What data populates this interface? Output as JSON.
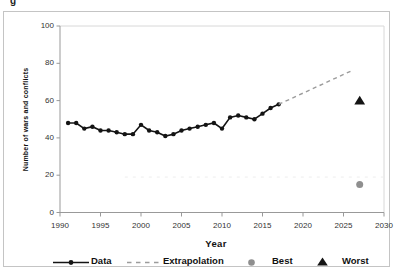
{
  "figure": {
    "corner_fragment": "g",
    "background": "#ffffff",
    "border_color": "#c4c4c4",
    "faint_line": {
      "value": 19,
      "from_year": 1998,
      "to_year": 2030,
      "color": "#ededed"
    }
  },
  "chart_data": {
    "type": "line",
    "title": "",
    "xlabel": "Year",
    "ylabel": "Number of wars and conflicts",
    "xlim": [
      1990,
      2030
    ],
    "ylim": [
      0,
      100
    ],
    "x_ticks": [
      1990,
      1995,
      2000,
      2005,
      2010,
      2015,
      2020,
      2025,
      2030
    ],
    "y_ticks": [
      0,
      20,
      40,
      60,
      80,
      100
    ],
    "grid": "off",
    "legend_position": "bottom",
    "axis_color": "#999999",
    "plot_border_color": "#d8d8d8",
    "series": [
      {
        "name": "Data",
        "type": "line",
        "marker": "circle",
        "color": "#141414",
        "x": [
          1991,
          1992,
          1993,
          1994,
          1995,
          1996,
          1997,
          1998,
          1999,
          2000,
          2001,
          2002,
          2003,
          2004,
          2005,
          2006,
          2007,
          2008,
          2009,
          2010,
          2011,
          2012,
          2013,
          2014,
          2015,
          2016,
          2017
        ],
        "values": [
          48,
          48,
          45,
          46,
          44,
          44,
          43,
          42,
          42,
          47,
          44,
          43,
          41,
          42,
          44,
          45,
          46,
          47,
          48,
          45,
          51,
          52,
          51,
          50,
          53,
          56,
          58
        ]
      },
      {
        "name": "Extrapolation",
        "type": "dashed-line",
        "color": "#9c9c9c",
        "x": [
          2017,
          2026
        ],
        "values": [
          58,
          76
        ]
      },
      {
        "name": "Best",
        "type": "point",
        "marker": "circle",
        "color": "#8f8f8f",
        "x": [
          2027
        ],
        "values": [
          15
        ]
      },
      {
        "name": "Worst",
        "type": "point",
        "marker": "triangle",
        "color": "#141414",
        "x": [
          2027
        ],
        "values": [
          60
        ]
      }
    ]
  }
}
